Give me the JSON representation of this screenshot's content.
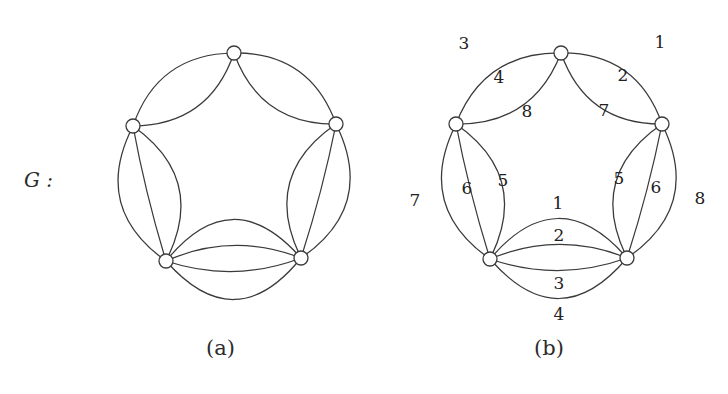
{
  "figure": {
    "graph_name": "G :",
    "captions": {
      "a": "(a)",
      "b": "(b)"
    },
    "stroke_color": "#3a3a3a",
    "vertex_fill": "#ffffff",
    "panel_a": {
      "name": "unlabeled-multigraph",
      "vertices": [
        {
          "id": "top",
          "cx": 234,
          "cy": 53,
          "r": 7
        },
        {
          "id": "upper-left",
          "cx": 133,
          "cy": 126,
          "r": 7
        },
        {
          "id": "upper-right",
          "cx": 336,
          "cy": 124,
          "r": 7
        },
        {
          "id": "lower-left",
          "cx": 166,
          "cy": 261,
          "r": 7
        },
        {
          "id": "lower-right",
          "cx": 301,
          "cy": 258,
          "r": 7
        }
      ],
      "edge_groups": [
        {
          "from": "upper-left",
          "to": "top",
          "count": 2
        },
        {
          "from": "top",
          "to": "upper-right",
          "count": 2
        },
        {
          "from": "upper-left",
          "to": "lower-left",
          "count": 3
        },
        {
          "from": "upper-right",
          "to": "lower-right",
          "count": 3
        },
        {
          "from": "lower-left",
          "to": "lower-right",
          "count": 4
        }
      ]
    },
    "panel_b": {
      "name": "labeled-multigraph",
      "vertices": [
        {
          "id": "top",
          "cx": 561,
          "cy": 53,
          "r": 7
        },
        {
          "id": "upper-left",
          "cx": 456,
          "cy": 124,
          "r": 7
        },
        {
          "id": "upper-right",
          "cx": 662,
          "cy": 124,
          "r": 7
        },
        {
          "id": "lower-left",
          "cx": 490,
          "cy": 259,
          "r": 7
        },
        {
          "id": "lower-right",
          "cx": 627,
          "cy": 258,
          "r": 7
        }
      ],
      "edge_labels": [
        {
          "text": "3",
          "x": 464,
          "y": 43
        },
        {
          "text": "1",
          "x": 660,
          "y": 42
        },
        {
          "text": "4",
          "x": 499,
          "y": 77
        },
        {
          "text": "2",
          "x": 623,
          "y": 75
        },
        {
          "text": "8",
          "x": 527,
          "y": 111
        },
        {
          "text": "7",
          "x": 604,
          "y": 110
        },
        {
          "text": "7",
          "x": 415,
          "y": 200
        },
        {
          "text": "6",
          "x": 467,
          "y": 188
        },
        {
          "text": "5",
          "x": 503,
          "y": 180
        },
        {
          "text": "5",
          "x": 619,
          "y": 178
        },
        {
          "text": "6",
          "x": 656,
          "y": 187
        },
        {
          "text": "8",
          "x": 700,
          "y": 198
        },
        {
          "text": "1",
          "x": 558,
          "y": 203
        },
        {
          "text": "2",
          "x": 559,
          "y": 235
        },
        {
          "text": "3",
          "x": 559,
          "y": 283
        },
        {
          "text": "4",
          "x": 559,
          "y": 314
        }
      ]
    }
  }
}
